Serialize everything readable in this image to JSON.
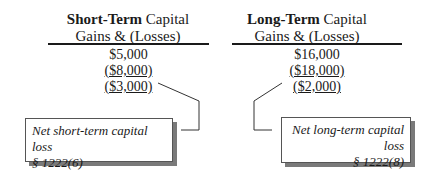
{
  "short_term": {
    "title_bold": "Short-Term",
    "title_rest": " Capital",
    "subtitle": "Gains & (Losses)",
    "values": [
      "$5,000",
      "($8,000)",
      "($3,000)"
    ],
    "note_line1": "Net short-term capital loss",
    "note_line2": "§ 1222(6)"
  },
  "long_term": {
    "title_bold": "Long-Term",
    "title_rest": " Capital",
    "subtitle": "Gains & (Losses)",
    "values": [
      "$16,000",
      "($18,000)",
      "($2,000)"
    ],
    "note_line1": "Net long-term capital loss",
    "note_line2": "§ 1222(8)"
  }
}
